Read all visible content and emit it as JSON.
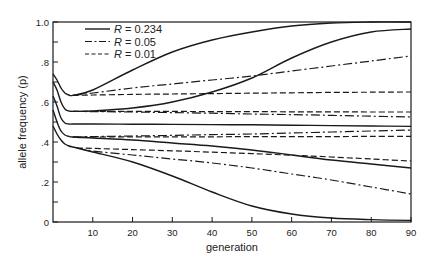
{
  "chart_data": {
    "type": "line",
    "title": "",
    "xlabel": "generation",
    "ylabel": "allele frequency (p)",
    "xlim": [
      0,
      90
    ],
    "ylim": [
      0,
      1.0
    ],
    "grid": false,
    "legend_position": "top-left inside",
    "x_ticks": [
      10,
      20,
      30,
      40,
      50,
      60,
      70,
      80,
      90
    ],
    "x_tick_labels": [
      "10",
      "20",
      "30",
      "40",
      "50",
      "60",
      "70",
      "80",
      "90"
    ],
    "y_ticks": [
      0,
      0.2,
      0.4,
      0.6,
      0.8,
      1.0
    ],
    "y_tick_labels": [
      "0",
      ".2",
      ".4",
      ".6",
      ".8",
      "1.0"
    ],
    "legend": [
      {
        "label_var": "R",
        "label_value": "= 0.234",
        "style": "solid"
      },
      {
        "label_var": "R",
        "label_value": "= 0.05",
        "style": "dashdot"
      },
      {
        "label_var": "R",
        "label_value": "= 0.01",
        "style": "dashed"
      }
    ],
    "series": [
      {
        "name": "R = 0.234 (high start, to fixation)",
        "style": "solid",
        "x": [
          0,
          1,
          2,
          3,
          4,
          5,
          10,
          20,
          30,
          40,
          50,
          60,
          70,
          80,
          90
        ],
        "y": [
          0.74,
          0.71,
          0.67,
          0.645,
          0.635,
          0.633,
          0.66,
          0.76,
          0.85,
          0.91,
          0.95,
          0.98,
          0.995,
          1.0,
          1.0
        ]
      },
      {
        "name": "R = 0.05 (high start)",
        "style": "dashdot",
        "x": [
          5,
          10,
          20,
          30,
          40,
          50,
          60,
          70,
          80,
          90
        ],
        "y": [
          0.633,
          0.645,
          0.67,
          0.69,
          0.71,
          0.73,
          0.755,
          0.78,
          0.805,
          0.83
        ]
      },
      {
        "name": "R = 0.01 (high start)",
        "style": "dashed",
        "x": [
          5,
          10,
          20,
          30,
          40,
          50,
          60,
          70,
          80,
          90
        ],
        "y": [
          0.633,
          0.635,
          0.638,
          0.64,
          0.642,
          0.644,
          0.646,
          0.648,
          0.649,
          0.65
        ]
      },
      {
        "name": "R = 0.234 (second start, to fixation)",
        "style": "solid",
        "x": [
          0,
          1,
          2,
          3,
          4,
          5,
          10,
          20,
          30,
          40,
          50,
          60,
          70,
          80,
          90
        ],
        "y": [
          0.7,
          0.66,
          0.6,
          0.565,
          0.555,
          0.553,
          0.555,
          0.57,
          0.6,
          0.65,
          0.72,
          0.82,
          0.9,
          0.95,
          0.965
        ]
      },
      {
        "name": "R = 0.01 (second start)",
        "style": "dashed",
        "x": [
          5,
          10,
          20,
          30,
          40,
          50,
          60,
          70,
          80,
          90
        ],
        "y": [
          0.553,
          0.553,
          0.553,
          0.553,
          0.552,
          0.552,
          0.551,
          0.551,
          0.55,
          0.55
        ]
      },
      {
        "name": "R = 0.05 (second start)",
        "style": "dashdot",
        "x": [
          5,
          10,
          20,
          30,
          40,
          50,
          60,
          70,
          80,
          90
        ],
        "y": [
          0.553,
          0.552,
          0.55,
          0.547,
          0.544,
          0.54,
          0.537,
          0.533,
          0.529,
          0.525
        ]
      },
      {
        "name": "R = 0.234 (middle, flat)",
        "style": "solid",
        "x": [
          0,
          1,
          2,
          3,
          4,
          5,
          10,
          20,
          30,
          40,
          50,
          60,
          70,
          80,
          90
        ],
        "y": [
          0.63,
          0.58,
          0.52,
          0.495,
          0.49,
          0.49,
          0.49,
          0.489,
          0.488,
          0.487,
          0.486,
          0.484,
          0.482,
          0.48,
          0.478
        ]
      },
      {
        "name": "R = 0.05 (lower-middle)",
        "style": "dashdot",
        "x": [
          5,
          10,
          20,
          30,
          40,
          50,
          60,
          70,
          80,
          90
        ],
        "y": [
          0.425,
          0.427,
          0.43,
          0.433,
          0.437,
          0.44,
          0.445,
          0.45,
          0.455,
          0.46
        ]
      },
      {
        "name": "R = 0.01 (lower-middle)",
        "style": "dashed",
        "x": [
          5,
          10,
          20,
          30,
          40,
          50,
          60,
          70,
          80,
          90
        ],
        "y": [
          0.425,
          0.425,
          0.426,
          0.426,
          0.426,
          0.427,
          0.427,
          0.427,
          0.428,
          0.428
        ]
      },
      {
        "name": "R = 0.234 (lower-middle)",
        "style": "solid",
        "x": [
          0,
          1,
          2,
          3,
          4,
          5,
          10,
          20,
          30,
          40,
          50,
          60,
          70,
          80,
          90
        ],
        "y": [
          0.56,
          0.5,
          0.455,
          0.435,
          0.428,
          0.425,
          0.42,
          0.41,
          0.395,
          0.38,
          0.36,
          0.335,
          0.31,
          0.29,
          0.27
        ]
      },
      {
        "name": "R = 0.01 (low start)",
        "style": "dashed",
        "x": [
          6,
          10,
          20,
          30,
          40,
          50,
          60,
          70,
          80,
          90
        ],
        "y": [
          0.37,
          0.368,
          0.362,
          0.356,
          0.349,
          0.342,
          0.334,
          0.325,
          0.315,
          0.305
        ]
      },
      {
        "name": "R = 0.05 (low start)",
        "style": "dashdot",
        "x": [
          6,
          10,
          20,
          30,
          40,
          50,
          60,
          70,
          80,
          90
        ],
        "y": [
          0.37,
          0.355,
          0.335,
          0.315,
          0.295,
          0.27,
          0.24,
          0.21,
          0.175,
          0.14
        ]
      },
      {
        "name": "R = 0.234 (low start, to loss)",
        "style": "solid",
        "x": [
          0,
          1,
          2,
          3,
          4,
          5,
          6,
          10,
          20,
          30,
          40,
          50,
          60,
          70,
          80,
          90
        ],
        "y": [
          0.48,
          0.44,
          0.41,
          0.39,
          0.38,
          0.375,
          0.37,
          0.35,
          0.3,
          0.23,
          0.15,
          0.08,
          0.04,
          0.02,
          0.012,
          0.008
        ]
      }
    ]
  }
}
